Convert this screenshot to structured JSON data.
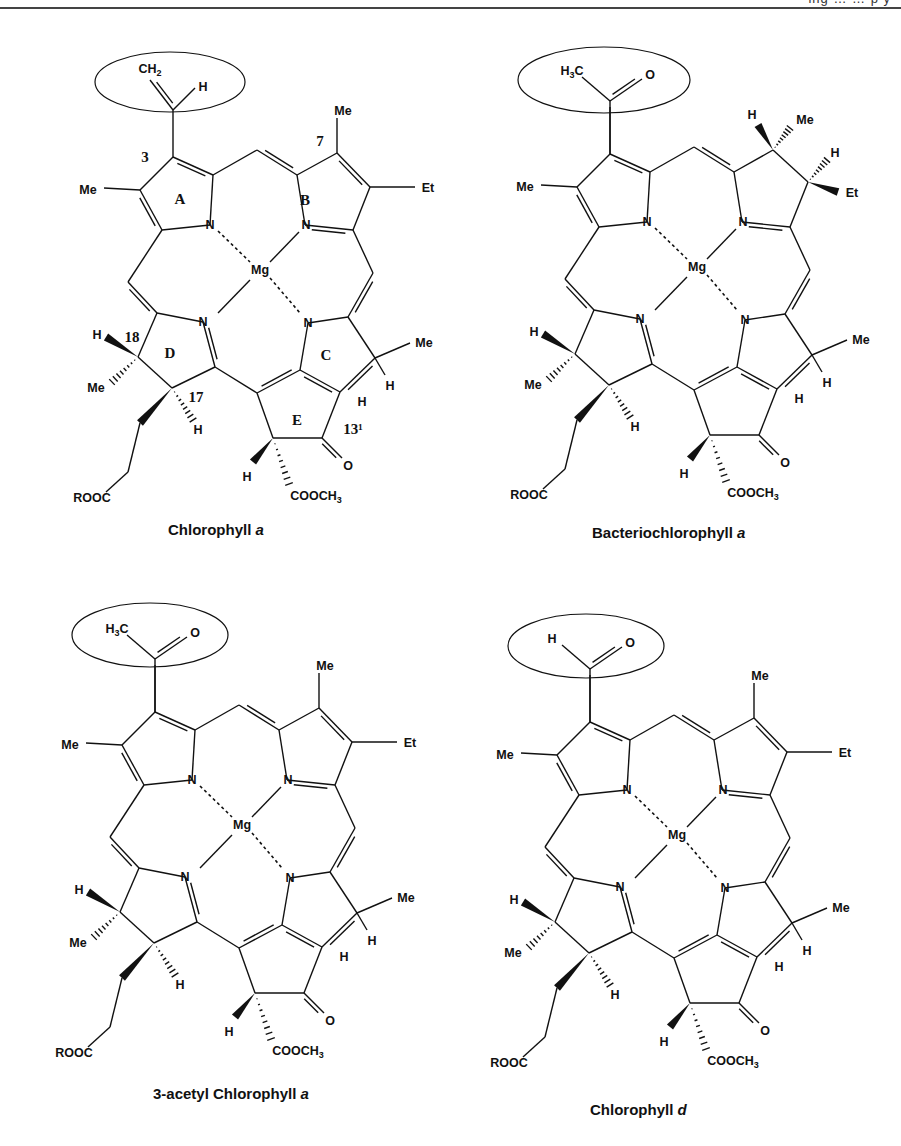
{
  "page": {
    "header_text": "ing … …  p  y",
    "colors": {
      "ink": "#111111",
      "rule": "#444444",
      "background": "#ffffff"
    }
  },
  "structures": [
    {
      "id": "chlorophyll-a",
      "title": "Chlorophyll ",
      "title_italic": "a",
      "offset": [
        0,
        0
      ],
      "title_pos": [
        168,
        535
      ],
      "highlight_ellipse": {
        "cx": 170,
        "cy": 82,
        "rx": 75,
        "ry": 30
      },
      "substituent_3": "vinyl",
      "substituent_labels": [
        "CH2",
        "H"
      ],
      "ring_b": "unsaturated",
      "ring_labels": [
        "A",
        "B",
        "C",
        "D",
        "E"
      ],
      "position_labels": [
        "3",
        "7",
        "18",
        "17",
        "13¹"
      ],
      "atoms": {
        "Me_ringA": "Me",
        "Et_ringB": "Et",
        "Me_ringB": "Me",
        "Mg": "Mg",
        "Me_ringC": "Me",
        "H_C": "H",
        "H_E": "H",
        "O": "O",
        "H_E_wedge": "H",
        "COOCH3": "COOCH3",
        "H18": "H",
        "Me18": "Me",
        "H17": "H",
        "ROOC": "ROOC"
      }
    },
    {
      "id": "bacteriochlorophyll-a",
      "title": "Bacteriochlorophyll ",
      "title_italic": "a",
      "offset": [
        437,
        -3
      ],
      "title_pos": [
        592,
        538
      ],
      "highlight_ellipse": {
        "cx": 604,
        "cy": 80,
        "rx": 86,
        "ry": 33
      },
      "substituent_3": "acetyl",
      "substituent_labels": [
        "H3C",
        "O"
      ],
      "ring_b": "saturated",
      "ring_b_labels": {
        "H7": "H",
        "Me7": "Me",
        "H8": "H",
        "Et8": "Et"
      },
      "atoms": {
        "Me_ringA": "Me",
        "Mg": "Mg",
        "Me_ringC": "Me",
        "H_C": "H",
        "H_E": "H",
        "O": "O",
        "H_E_wedge": "H",
        "COOCH3": "COOCH3",
        "H18": "H",
        "Me18": "Me",
        "H17": "H",
        "ROOC": "ROOC"
      }
    },
    {
      "id": "3-acetyl-chlorophyll-a",
      "title": "3-acetyl Chlorophyll ",
      "title_italic": "a",
      "offset": [
        -18,
        555
      ],
      "title_pos": [
        153,
        1099
      ],
      "highlight_ellipse": {
        "cx": 150,
        "cy": 635,
        "rx": 78,
        "ry": 32
      },
      "substituent_3": "acetyl",
      "substituent_labels": [
        "H3C",
        "O"
      ],
      "ring_b": "unsaturated",
      "atoms": {
        "Me_ringA": "Me",
        "Et_ringB": "Et",
        "Me_ringB": "Me",
        "Mg": "Mg",
        "Me_ringC": "Me",
        "H_C": "H",
        "H_E": "H",
        "O": "O",
        "H_E_wedge": "H",
        "COOCH3": "COOCH3",
        "H18": "H",
        "Me18": "Me",
        "H17": "H",
        "ROOC": "ROOC"
      }
    },
    {
      "id": "chlorophyll-d",
      "title": "Chlorophyll ",
      "title_italic": "d",
      "offset": [
        417,
        565
      ],
      "title_pos": [
        590,
        1115
      ],
      "highlight_ellipse": {
        "cx": 586,
        "cy": 646,
        "rx": 78,
        "ry": 32
      },
      "substituent_3": "formyl",
      "substituent_labels": [
        "H",
        "O"
      ],
      "ring_b": "unsaturated",
      "atoms": {
        "Me_ringA": "Me",
        "Et_ringB": "Et",
        "Me_ringB": "Me",
        "Mg": "Mg",
        "Me_ringC": "Me",
        "H_C": "H",
        "H_E": "H",
        "O": "O",
        "H_E_wedge": "H",
        "COOCH3": "COOCH3",
        "H18": "H",
        "Me18": "Me",
        "H17": "H",
        "ROOC": "ROOC"
      }
    }
  ]
}
